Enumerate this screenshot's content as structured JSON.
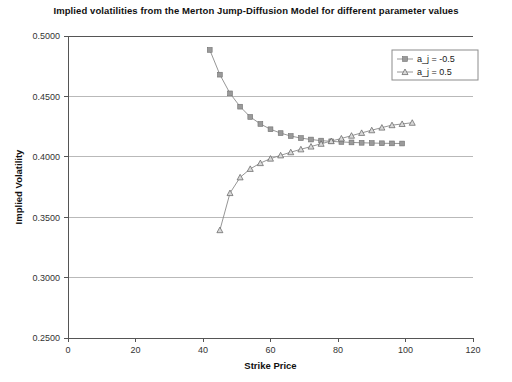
{
  "chart_data": {
    "type": "line",
    "title": "Implied volatilities from the Merton Jump-Diffusion Model for different parameter values",
    "xlabel": "Strike Price",
    "ylabel": "Implied Volatility",
    "xlim": [
      0,
      120
    ],
    "ylim": [
      0.25,
      0.5
    ],
    "xticks": [
      0,
      20,
      40,
      60,
      80,
      100,
      120
    ],
    "xtick_labels": [
      "0",
      "20",
      "40",
      "60",
      "80",
      "100",
      "120"
    ],
    "yticks": [
      0.25,
      0.3,
      0.35,
      0.4,
      0.45,
      0.5
    ],
    "ytick_labels": [
      "0.2500",
      "0.3000",
      "0.3500",
      "0.4000",
      "0.4500",
      "0.5000"
    ],
    "grid": true,
    "grid_axis": "y",
    "legend_position": "upper-right",
    "series": [
      {
        "name": "a_j = -0.5",
        "marker": "square",
        "color": "#9a9a9a",
        "x": [
          42,
          45,
          48,
          51,
          54,
          57,
          60,
          63,
          66,
          69,
          72,
          75,
          78,
          81,
          84,
          87,
          90,
          93,
          96,
          99
        ],
        "y": [
          0.4885,
          0.468,
          0.4525,
          0.4415,
          0.433,
          0.4272,
          0.4228,
          0.4196,
          0.4172,
          0.4155,
          0.4143,
          0.4134,
          0.4128,
          0.4123,
          0.4119,
          0.4116,
          0.4114,
          0.4112,
          0.4111,
          0.411
        ]
      },
      {
        "name": "a_j = 0.5",
        "marker": "triangle",
        "color": "#5e5e5e",
        "x": [
          45,
          48,
          51,
          54,
          57,
          60,
          63,
          66,
          69,
          72,
          75,
          78,
          81,
          84,
          87,
          90,
          93,
          96,
          99,
          102
        ],
        "y": [
          0.3393,
          0.37,
          0.383,
          0.39,
          0.3948,
          0.3985,
          0.4012,
          0.4038,
          0.4062,
          0.4085,
          0.4108,
          0.413,
          0.4152,
          0.4175,
          0.4198,
          0.422,
          0.4242,
          0.4262,
          0.4272,
          0.4282
        ]
      }
    ]
  }
}
